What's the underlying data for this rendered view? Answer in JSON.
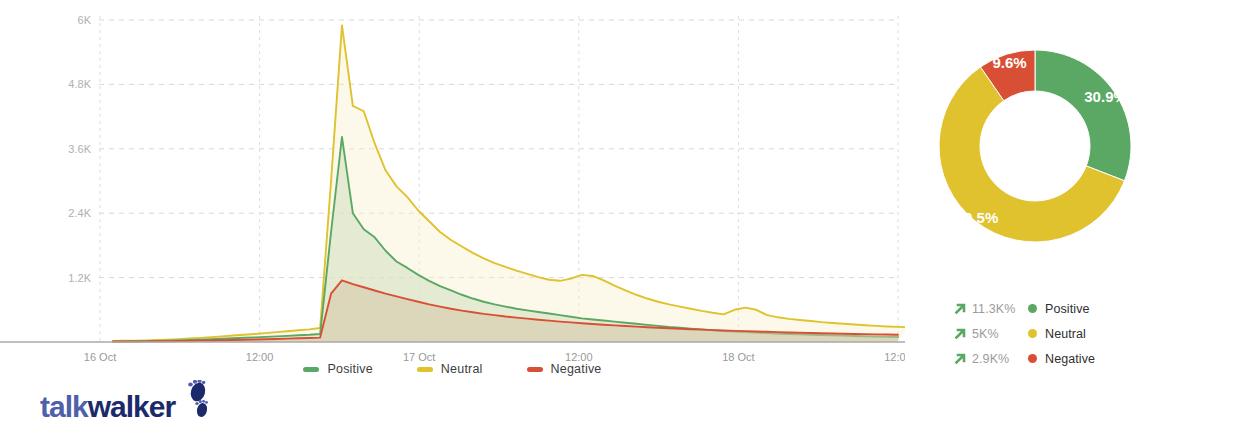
{
  "brand": {
    "logo_part1": "talk",
    "logo_part2": "walker",
    "color_part1": "#4f5faa",
    "color_part2": "#1b2a6b"
  },
  "colors": {
    "positive": "#5aa863",
    "neutral": "#dfc22e",
    "negative": "#d94f35",
    "positive_fill": "#cfe0bd",
    "neutral_fill": "#f7f1cf",
    "negative_fill": "#d6c6a6",
    "grid": "#d8d8d8",
    "axis": "#a9a9a9",
    "tick_text": "#9a9a9a",
    "stat_value_text": "#9b9b9b",
    "stat_arrow": "#5aa863"
  },
  "chart_data": [
    {
      "type": "area",
      "title": "",
      "xlabel": "",
      "ylabel": "",
      "grid": true,
      "legend_position": "bottom",
      "ylim": [
        0,
        6000
      ],
      "yticks": [
        1200,
        2400,
        3600,
        4800,
        6000
      ],
      "ytick_labels": [
        "1.2K",
        "2.4K",
        "3.6K",
        "4.8K",
        "6K"
      ],
      "xtick_labels": [
        "16 Oct",
        "12:00",
        "17 Oct",
        "12:00",
        "18 Oct",
        "12:00"
      ],
      "x": [
        0,
        1,
        2,
        3,
        4,
        5,
        6,
        7,
        8,
        9,
        10,
        11,
        12,
        13,
        14,
        15,
        16,
        17,
        18,
        19,
        20,
        21,
        22,
        23,
        24,
        25,
        26,
        27,
        28,
        29,
        30,
        31,
        32,
        33,
        34,
        35,
        36,
        37,
        38,
        39,
        40,
        41,
        42,
        43,
        44,
        45,
        46,
        47,
        48,
        49,
        50,
        51,
        52,
        53,
        54,
        55,
        56,
        57,
        58,
        59,
        60,
        61,
        62,
        63,
        64,
        65,
        66,
        67,
        68,
        69,
        70,
        71,
        72
      ],
      "series": [
        {
          "name": "Positive",
          "color": "#5aa863",
          "fill": "#cfe0bd",
          "values": [
            10,
            12,
            14,
            16,
            20,
            24,
            30,
            36,
            44,
            52,
            60,
            70,
            78,
            86,
            95,
            105,
            115,
            125,
            135,
            150,
            2050,
            3820,
            2400,
            2100,
            1950,
            1700,
            1500,
            1380,
            1250,
            1140,
            1040,
            960,
            880,
            810,
            750,
            700,
            660,
            620,
            590,
            560,
            530,
            500,
            470,
            440,
            420,
            400,
            380,
            360,
            340,
            320,
            300,
            280,
            265,
            250,
            235,
            220,
            205,
            195,
            185,
            175,
            165,
            155,
            148,
            142,
            136,
            130,
            124,
            118,
            112,
            106,
            100,
            96,
            92
          ]
        },
        {
          "name": "Neutral",
          "color": "#dfc22e",
          "fill": "#f7f1cf",
          "values": [
            18,
            22,
            26,
            30,
            36,
            44,
            54,
            64,
            76,
            90,
            104,
            120,
            134,
            150,
            166,
            184,
            200,
            218,
            236,
            260,
            3000,
            5900,
            4400,
            4300,
            3700,
            3200,
            2900,
            2700,
            2450,
            2250,
            2050,
            1900,
            1780,
            1660,
            1560,
            1470,
            1400,
            1330,
            1270,
            1210,
            1160,
            1140,
            1180,
            1250,
            1230,
            1150,
            1050,
            960,
            880,
            810,
            750,
            700,
            660,
            620,
            580,
            545,
            515,
            600,
            640,
            600,
            500,
            460,
            430,
            410,
            390,
            370,
            355,
            340,
            325,
            312,
            300,
            290,
            282,
            275
          ]
        },
        {
          "name": "Negative",
          "color": "#d94f35",
          "fill": "#d6c6a6",
          "values": [
            8,
            9,
            10,
            11,
            13,
            15,
            18,
            21,
            25,
            29,
            33,
            38,
            42,
            47,
            52,
            57,
            63,
            69,
            75,
            82,
            900,
            1150,
            1080,
            1020,
            960,
            900,
            850,
            800,
            750,
            700,
            660,
            620,
            585,
            555,
            525,
            500,
            475,
            455,
            435,
            415,
            398,
            380,
            365,
            350,
            336,
            322,
            310,
            298,
            286,
            275,
            265,
            255,
            246,
            238,
            230,
            222,
            215,
            208,
            202,
            196,
            190,
            184,
            178,
            173,
            168,
            163,
            158,
            154,
            150,
            146,
            142,
            139,
            136
          ]
        }
      ],
      "legend": [
        {
          "label": "Positive",
          "color": "#5aa863"
        },
        {
          "label": "Neutral",
          "color": "#dfc22e"
        },
        {
          "label": "Negative",
          "color": "#d94f35"
        }
      ]
    },
    {
      "type": "pie",
      "title": "",
      "donut": true,
      "labels": [
        "Positive",
        "Neutral",
        "Negative"
      ],
      "values": [
        30.9,
        59.5,
        9.6
      ],
      "value_labels": [
        "30.9%",
        "59.5%",
        "9.6%"
      ],
      "colors": [
        "#5aa863",
        "#dfc22e",
        "#d94f35"
      ],
      "start_angle_deg": 0
    }
  ],
  "stats": {
    "rows": [
      {
        "trend": "up",
        "value": "11.3K%",
        "label": "Positive",
        "color": "#5aa863"
      },
      {
        "trend": "up",
        "value": "5K%",
        "label": "Neutral",
        "color": "#dfc22e"
      },
      {
        "trend": "up",
        "value": "2.9K%",
        "label": "Negative",
        "color": "#d94f35"
      }
    ]
  }
}
